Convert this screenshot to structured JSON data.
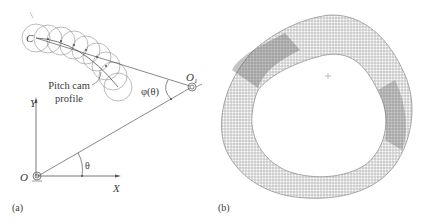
{
  "figure": {
    "panel_a": {
      "caption": "(a)",
      "labels": {
        "cam_point": "C",
        "pivot": "O",
        "pivot_subscript": "1",
        "origin": "O",
        "y_axis": "Y",
        "x_axis": "X",
        "theta": "θ",
        "phi": "φ(θ)",
        "callout_line1": "Pitch cam",
        "callout_line2": "profile"
      }
    },
    "panel_b": {
      "caption": "(b)",
      "description": "Cam profile generated as envelope of roller follower circles"
    },
    "colors": {
      "line": "#555555",
      "circle": "#8a8a8a",
      "envelope": "#6a6a6a",
      "text": "#3a3a3a"
    }
  }
}
